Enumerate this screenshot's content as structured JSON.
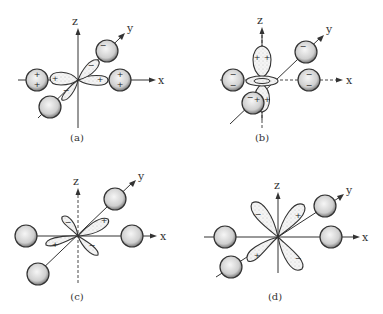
{
  "figure": {
    "panels": [
      {
        "id": "a",
        "caption": "(a)",
        "axes": {
          "x": "x",
          "y": "y",
          "z": "z"
        }
      },
      {
        "id": "b",
        "caption": "(b)",
        "axes": {
          "x": "x",
          "y": "y",
          "z": "z"
        }
      },
      {
        "id": "c",
        "caption": "(c)",
        "axes": {
          "x": "x",
          "y": "y",
          "z": "z"
        }
      },
      {
        "id": "d",
        "caption": "(d)",
        "axes": {
          "x": "x",
          "y": "y",
          "z": "z"
        }
      }
    ],
    "signs": {
      "plus": "+",
      "minus": "−"
    }
  }
}
